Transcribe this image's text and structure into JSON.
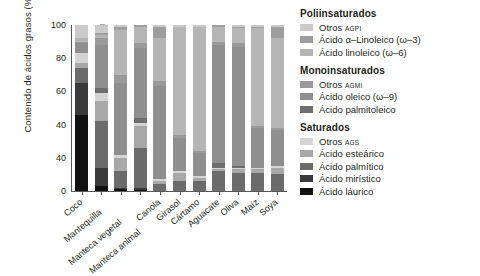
{
  "chart_data": {
    "type": "bar",
    "stacked": true,
    "stack_mode": "percent",
    "title": "",
    "xlabel": "",
    "ylabel": "Contenido de ácidos grasos (%)",
    "ylim": [
      0,
      100
    ],
    "ytick_labels": [
      "100",
      "80",
      "60",
      "40",
      "40",
      "0"
    ],
    "ytick_values": [
      100,
      80,
      60,
      40,
      20,
      0
    ],
    "grid": false,
    "legend_position": "right",
    "categories": [
      "Coco",
      "Mantequilla",
      "Manteca vegetal",
      "Manteca animal",
      "Canola",
      "Girasol",
      "Cártamo",
      "Aguacate",
      "Oliva",
      "Maíz",
      "Soya"
    ],
    "series": [
      {
        "name": "Ácido láurico",
        "group": "Saturados",
        "color": "#111111",
        "values": [
          46,
          3,
          1,
          0.5,
          0,
          0,
          0,
          0,
          0,
          0,
          0
        ]
      },
      {
        "name": "Ácido mirístico",
        "group": "Saturados",
        "color": "#3a3a3a",
        "values": [
          19,
          11,
          1,
          1.5,
          0,
          0,
          0,
          0,
          0,
          0,
          0
        ]
      },
      {
        "name": "Ácido palmítico",
        "group": "Saturados",
        "color": "#6b6b6b",
        "values": [
          9,
          28,
          10,
          24,
          4,
          6,
          6,
          12,
          11,
          11,
          10
        ]
      },
      {
        "name": "Ácido esteárico",
        "group": "Saturados",
        "color": "#a8a8a8",
        "values": [
          3,
          12,
          8,
          13,
          2,
          5,
          2,
          1,
          2,
          2,
          4
        ]
      },
      {
        "name": "Otros AGS",
        "group": "Saturados",
        "color": "#d4d4d4",
        "values": [
          6,
          5,
          2,
          2,
          1,
          1,
          1,
          1,
          1,
          1,
          1
        ]
      },
      {
        "name": "Ácido palmitoleico",
        "group": "Monoinsaturados",
        "color": "#6e6e6e",
        "values": [
          0,
          3,
          0,
          3,
          0,
          0,
          0,
          3,
          1,
          0,
          0
        ]
      },
      {
        "name": "Ácido oleico (ω-9)",
        "group": "Monoinsaturados",
        "color": "#8f8f8f",
        "values": [
          6,
          26,
          43,
          42,
          56,
          20,
          14,
          71,
          72,
          24,
          22
        ]
      },
      {
        "name": "Otros AGMI",
        "group": "Monoinsaturados",
        "color": "#9a9a9a",
        "values": [
          1,
          4,
          5,
          3,
          3,
          2,
          1,
          2,
          2,
          1,
          1
        ]
      },
      {
        "name": "Ácido linoleico (ω-6)",
        "group": "Poliinsaturados",
        "color": "#b5b5b5",
        "values": [
          2,
          2,
          27,
          10,
          26,
          65,
          75,
          9,
          9,
          59,
          54
        ]
      },
      {
        "name": "Ácido α-Linoleico (ω-3)",
        "group": "Poliinsaturados",
        "color": "#9e9e9e",
        "values": [
          0,
          1,
          2,
          1,
          7,
          0,
          0,
          1,
          1,
          1,
          7
        ]
      },
      {
        "name": "Otros AGPI",
        "group": "Poliinsaturados",
        "color": "#cacaca",
        "values": [
          8,
          5,
          1,
          0,
          1,
          1,
          1,
          0,
          1,
          1,
          1
        ]
      }
    ]
  },
  "legend": {
    "groups": [
      {
        "title": "Poliinsaturados",
        "items": [
          {
            "label": "Otros ",
            "sub": "AGPI",
            "color": "#cacaca",
            "swatch": "legend-swatch-otros-agpi"
          },
          {
            "label": "Ácido α–Linoleico (ω–3)",
            "sub": "",
            "color": "#9e9e9e",
            "swatch": "legend-swatch-alfa-linoleico"
          },
          {
            "label": "Ácido linoleico (ω–6)",
            "sub": "",
            "color": "#b5b5b5",
            "swatch": "legend-swatch-linoleico"
          }
        ]
      },
      {
        "title": "Monoinsaturados",
        "items": [
          {
            "label": "Otros ",
            "sub": "AGMI",
            "color": "#9a9a9a",
            "swatch": "legend-swatch-otros-agmi"
          },
          {
            "label": "Ácido oleico (ω–9)",
            "sub": "",
            "color": "#8f8f8f",
            "swatch": "legend-swatch-oleico"
          },
          {
            "label": "Ácido palmitoleico",
            "sub": "",
            "color": "#6e6e6e",
            "swatch": "legend-swatch-palmitoleico"
          }
        ]
      },
      {
        "title": "Saturados",
        "items": [
          {
            "label": "Otros ",
            "sub": "AGS",
            "color": "#d4d4d4",
            "swatch": "legend-swatch-otros-ags"
          },
          {
            "label": "Ácido esteárico",
            "sub": "",
            "color": "#a8a8a8",
            "swatch": "legend-swatch-estearico"
          },
          {
            "label": "Ácido palmítico",
            "sub": "",
            "color": "#6b6b6b",
            "swatch": "legend-swatch-palmitico"
          },
          {
            "label": "Ácido mirístico",
            "sub": "",
            "color": "#3a3a3a",
            "swatch": "legend-swatch-miristico"
          },
          {
            "label": "Ácido láurico",
            "sub": "",
            "color": "#111111",
            "swatch": "legend-swatch-laurico"
          }
        ]
      }
    ]
  }
}
